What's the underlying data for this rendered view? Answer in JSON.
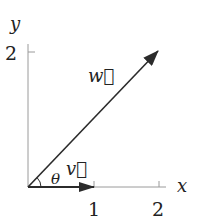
{
  "diagram": {
    "type": "vector-diagram",
    "axes": {
      "x_label": "x",
      "y_label": "y",
      "x_ticks": [
        "1",
        "2"
      ],
      "y_ticks": [
        "2"
      ]
    },
    "vectors": [
      {
        "name": "v",
        "label": "v⃗",
        "from": [
          0,
          0
        ],
        "to": [
          1,
          0
        ]
      },
      {
        "name": "w",
        "label": "w⃗",
        "from": [
          0,
          0
        ],
        "to": [
          2,
          2
        ]
      }
    ],
    "angle_label": "θ",
    "colors": {
      "axis": "#9a9a9a",
      "vector": "#2b2b2b",
      "text": "#222222"
    }
  }
}
